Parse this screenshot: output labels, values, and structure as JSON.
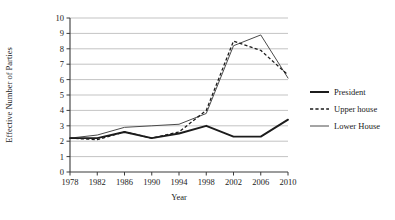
{
  "chart_data": {
    "type": "line",
    "title": "",
    "xlabel": "Year",
    "ylabel": "Effective Number of Parties",
    "categories": [
      "1978",
      "1982",
      "1986",
      "1990",
      "1994",
      "1998",
      "2002",
      "2006",
      "2010"
    ],
    "x": [
      1978,
      1982,
      1986,
      1990,
      1994,
      1998,
      2002,
      2006,
      2010
    ],
    "xlim": [
      1978,
      2010
    ],
    "ylim": [
      0,
      10
    ],
    "yticks": [
      "0",
      "1",
      "2",
      "3",
      "4",
      "5",
      "6",
      "7",
      "8",
      "9",
      "10"
    ],
    "ytick_values": [
      0,
      1,
      2,
      3,
      4,
      5,
      6,
      7,
      8,
      9,
      10
    ],
    "grid": "horizontal",
    "legend_position": "right",
    "series": [
      {
        "name": "President",
        "style": "solid-thick",
        "color": "#1c1c1c",
        "values": [
          2.2,
          2.2,
          2.6,
          2.2,
          2.5,
          3.0,
          2.3,
          2.3,
          3.4
        ]
      },
      {
        "name": "Upper house",
        "style": "dashed",
        "color": "#1c1c1c",
        "values": [
          2.2,
          2.1,
          2.6,
          2.2,
          2.6,
          4.0,
          8.5,
          7.9,
          6.3
        ]
      },
      {
        "name": "Lower House",
        "style": "solid-thin",
        "color": "#4a4a4a",
        "values": [
          2.2,
          2.4,
          2.9,
          3.0,
          3.1,
          3.8,
          8.2,
          8.9,
          6.1
        ]
      }
    ]
  }
}
